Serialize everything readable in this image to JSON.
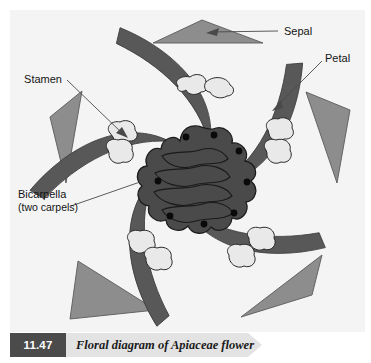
{
  "figure": {
    "caption_number": "11.47",
    "caption_text": "Floral diagram of Apiaceae flower",
    "panel_background": "#f4f4f4",
    "page_background": "#ffffff"
  },
  "labels": {
    "sepal": "Sepal",
    "petal": "Petal",
    "stamen": "Stamen",
    "bicarpella_line1": "Bicarpella",
    "bicarpella_line2": "(two carpels)"
  },
  "colors": {
    "sepal_fill": "#8d8d8d",
    "sepal_stroke": "#5a5a5a",
    "petal_fill": "#585858",
    "petal_stroke": "#3c3c3c",
    "stamen_fill": "#e9e9e9",
    "stamen_stroke": "#2a2a2a",
    "ovary_fill": "#4a4a4a",
    "ovary_stroke": "#1c1c1c",
    "ovule_dot": "#0a0a0a",
    "leader_line": "#4a4a4a",
    "caption_box": "#4b4b4b",
    "caption_bar": "#e3e3e3",
    "text": "#141414"
  },
  "diagram_parts": {
    "sepals_count": 5,
    "petals_count": 5,
    "stamens_count": 5,
    "carpels_count": 2,
    "ovule_dots_count": 8
  }
}
